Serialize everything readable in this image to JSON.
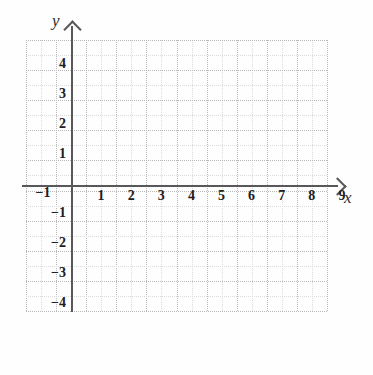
{
  "figure": {
    "kind": "cartesian-coordinate-grid",
    "background_color": "#fefefe",
    "axis_color": "#58585a",
    "major_gridline_color": "#b9b9b9",
    "minor_gridline_color": "#dcdcdc"
  },
  "axes": {
    "x": {
      "name": "x",
      "arrow": "right",
      "tick_labels": [
        "1",
        "2",
        "3",
        "4",
        "5",
        "6",
        "7",
        "8",
        "9"
      ],
      "negative_tick_label": "−1"
    },
    "y": {
      "name": "y",
      "arrow": "up",
      "tick_labels_positive": [
        "4",
        "3",
        "2",
        "1"
      ],
      "tick_labels_negative": [
        "−1",
        "−2",
        "−3",
        "−4"
      ]
    }
  },
  "chart_data": {
    "type": "scatter",
    "title": "",
    "subtitle": "",
    "xlabel": "x",
    "ylabel": "y",
    "x": [],
    "y": [],
    "series": [],
    "xlim": [
      -1.5,
      10
    ],
    "ylim": [
      -4.9,
      4.9
    ],
    "xticks": [
      -1,
      1,
      2,
      3,
      4,
      5,
      6,
      7,
      8,
      9
    ],
    "yticks": [
      4,
      3,
      2,
      1,
      -1,
      -2,
      -3,
      -4
    ],
    "xtick_labels": [
      "−1",
      "1",
      "2",
      "3",
      "4",
      "5",
      "6",
      "7",
      "8",
      "9"
    ],
    "ytick_labels": [
      "4",
      "3",
      "2",
      "1",
      "−1",
      "−2",
      "−3",
      "−4"
    ],
    "grid": true,
    "grid_style": "dotted",
    "minor_grid": true,
    "legend": null,
    "annotations": [],
    "note": "Empty blank coordinate plane; no data plotted."
  }
}
